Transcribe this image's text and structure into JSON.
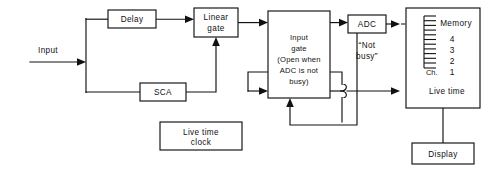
{
  "diagram": {
    "background_color": "#ffffff",
    "line_color": "#111111",
    "blocks": [
      {
        "id": "delay",
        "label": "Delay",
        "x": 108,
        "y": 10,
        "w": 48,
        "h": 18
      },
      {
        "id": "linear_gate",
        "label_line1": "Linear",
        "label_line2": "gate",
        "x": 194,
        "y": 8,
        "w": 44,
        "h": 29
      },
      {
        "id": "sca",
        "label": "SCA",
        "x": 140,
        "y": 83,
        "w": 46,
        "h": 18
      },
      {
        "id": "input_gate",
        "label_line1": "Input",
        "label_line2": "gate",
        "label_line3": "(Open when",
        "label_line4": "ADC is not",
        "label_line5": "busy)",
        "x": 268,
        "y": 11,
        "w": 62,
        "h": 87
      },
      {
        "id": "adc",
        "label": "ADC",
        "x": 348,
        "y": 15,
        "w": 38,
        "h": 18
      },
      {
        "id": "memory",
        "label_memory": "Memory",
        "label_livetime": "Live time",
        "x": 406,
        "y": 8,
        "w": 74,
        "h": 100
      },
      {
        "id": "live_time_clock",
        "label_line1": "Live time",
        "label_line2": "clock",
        "x": 160,
        "y": 122,
        "w": 82,
        "h": 28
      },
      {
        "id": "display",
        "label": "Display",
        "x": 412,
        "y": 143,
        "w": 62,
        "h": 21
      }
    ],
    "free_labels": [
      {
        "id": "input",
        "text": "Input",
        "x": 48,
        "y": 56
      },
      {
        "id": "not_busy_line1",
        "text": "“Not",
        "x": 367,
        "y": 46
      },
      {
        "id": "not_busy_line2",
        "text": "busy”",
        "x": 367,
        "y": 58
      }
    ],
    "channel_scale": {
      "label_ch": "Ch.",
      "numbers": [
        "4",
        "3",
        "2",
        "1"
      ],
      "tick_count": 12
    },
    "signal_paths": [
      {
        "id": "input-to-bus",
        "kind": "solid",
        "from": "Input",
        "to": "signal bus"
      },
      {
        "id": "bus-to-delay",
        "kind": "solid",
        "from": "signal bus",
        "to": "Delay"
      },
      {
        "id": "delay-to-linear-gate",
        "kind": "solid",
        "from": "Delay",
        "to": "Linear gate"
      },
      {
        "id": "bus-to-sca",
        "kind": "solid",
        "from": "signal bus",
        "to": "SCA"
      },
      {
        "id": "sca-to-linear-gate",
        "kind": "solid",
        "from": "SCA",
        "to": "Linear gate"
      },
      {
        "id": "linear-gate-to-input-gate",
        "kind": "solid",
        "from": "Linear gate",
        "to": "Input gate"
      },
      {
        "id": "input-gate-to-adc",
        "kind": "dashed",
        "from": "Input gate",
        "to": "ADC"
      },
      {
        "id": "adc-to-memory",
        "kind": "dashed",
        "from": "ADC",
        "to": "Memory"
      },
      {
        "id": "adc-not-busy-feedback",
        "kind": "solid",
        "from": "ADC",
        "to": "Input gate"
      },
      {
        "id": "clock-to-input-gate",
        "kind": "solid",
        "from": "Live time clock",
        "to": "Input gate"
      },
      {
        "id": "input-gate-to-live-time",
        "kind": "dashed",
        "from": "Input gate",
        "to": "Live time"
      },
      {
        "id": "memory-to-display",
        "kind": "solid",
        "from": "Memory",
        "to": "Display"
      }
    ]
  }
}
